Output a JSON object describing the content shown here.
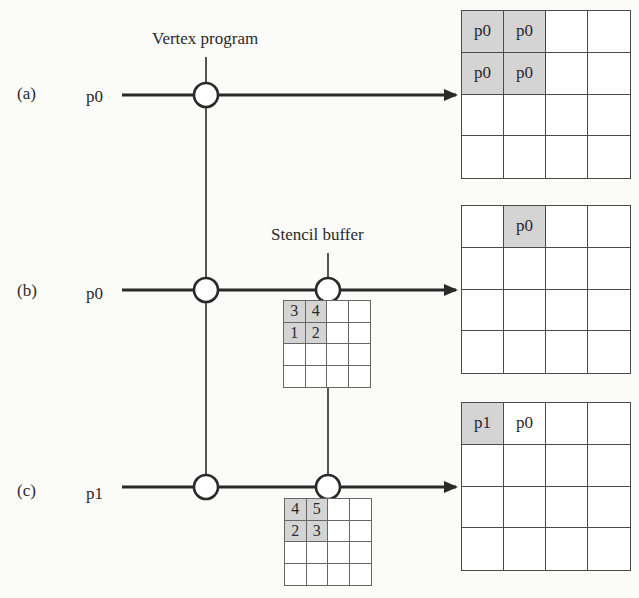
{
  "diagram": {
    "headers": {
      "vertex_program": "Vertex program",
      "stencil_buffer": "Stencil buffer"
    },
    "rows": [
      {
        "id": "a",
        "tag": "(a)",
        "input": "p0",
        "stages": [
          "vertex-program"
        ],
        "stencil": null,
        "framebuffer": [
          [
            "p0",
            "p0",
            "",
            ""
          ],
          [
            "p0",
            "p0",
            "",
            ""
          ],
          [
            "",
            "",
            "",
            ""
          ],
          [
            "",
            "",
            "",
            ""
          ]
        ],
        "framebuffer_shaded": [
          [
            0,
            0
          ],
          [
            0,
            1
          ],
          [
            1,
            0
          ],
          [
            1,
            1
          ]
        ]
      },
      {
        "id": "b",
        "tag": "(b)",
        "input": "p0",
        "stages": [
          "vertex-program",
          "stencil-buffer"
        ],
        "stencil": [
          [
            "3",
            "4",
            "",
            ""
          ],
          [
            "1",
            "2",
            "",
            ""
          ],
          [
            "",
            "",
            "",
            ""
          ],
          [
            "",
            "",
            "",
            ""
          ]
        ],
        "stencil_shaded": [
          [
            0,
            0
          ],
          [
            0,
            1
          ],
          [
            1,
            0
          ],
          [
            1,
            1
          ]
        ],
        "framebuffer": [
          [
            "",
            "p0",
            "",
            ""
          ],
          [
            "",
            "",
            "",
            ""
          ],
          [
            "",
            "",
            "",
            ""
          ],
          [
            "",
            "",
            "",
            ""
          ]
        ],
        "framebuffer_shaded": [
          [
            0,
            1
          ]
        ]
      },
      {
        "id": "c",
        "tag": "(c)",
        "input": "p1",
        "stages": [
          "vertex-program",
          "stencil-buffer"
        ],
        "stencil": [
          [
            "4",
            "5",
            "",
            ""
          ],
          [
            "2",
            "3",
            "",
            ""
          ],
          [
            "",
            "",
            "",
            ""
          ],
          [
            "",
            "",
            "",
            ""
          ]
        ],
        "stencil_shaded": [
          [
            0,
            0
          ],
          [
            0,
            1
          ],
          [
            1,
            0
          ],
          [
            1,
            1
          ]
        ],
        "framebuffer": [
          [
            "p1",
            "p0",
            "",
            ""
          ],
          [
            "",
            "",
            "",
            ""
          ],
          [
            "",
            "",
            "",
            ""
          ],
          [
            "",
            "",
            "",
            ""
          ]
        ],
        "framebuffer_shaded": [
          [
            0,
            0
          ]
        ]
      }
    ],
    "colors": {
      "line": "#2a2a2a",
      "shaded_cell": "#d4d4d4",
      "grid_line": "#4a4a4a",
      "background": "#fbfbfa"
    }
  }
}
